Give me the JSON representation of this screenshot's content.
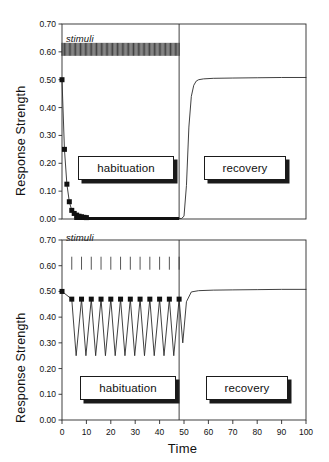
{
  "figure": {
    "top_cut_text": "",
    "x_axis": {
      "label": "Time",
      "ticks": [
        0,
        10,
        20,
        30,
        40,
        50,
        60,
        70,
        80,
        90,
        100
      ],
      "tick_labels": [
        "0",
        "10",
        "20",
        "30",
        "40",
        "50",
        "60",
        "70",
        "80",
        "90",
        "100"
      ],
      "min": 0,
      "max": 100
    },
    "panels": [
      {
        "name": "top-panel",
        "y_axis": {
          "label": "Response Strength",
          "ticks": [
            0.0,
            0.1,
            0.2,
            0.3,
            0.4,
            0.5,
            0.6,
            0.7
          ],
          "tick_labels": [
            "0.00",
            "0.10",
            "0.20",
            "0.30",
            "0.40",
            "0.50",
            "0.60",
            "0.70"
          ],
          "min": 0.0,
          "max": 0.7
        },
        "stimuli": {
          "label": "stimuli",
          "y": 0.6,
          "start": 0,
          "end": 48,
          "count": 96,
          "spacing": 0.5
        },
        "phase_labels": [
          {
            "text": "habituation",
            "start": 7,
            "end": 44
          },
          {
            "text": "recovery",
            "start": 56,
            "end": 93
          }
        ],
        "divider_x": 48
      },
      {
        "name": "bottom-panel",
        "y_axis": {
          "label": "Response Strength",
          "ticks": [
            0.0,
            0.1,
            0.2,
            0.3,
            0.4,
            0.5,
            0.6,
            0.7
          ],
          "tick_labels": [
            "0.00",
            "0.10",
            "0.20",
            "0.30",
            "0.40",
            "0.50",
            "0.60",
            "0.70"
          ],
          "min": 0.0,
          "max": 0.7
        },
        "stimuli": {
          "label": "stimuli",
          "y": 0.6,
          "start": 4,
          "end": 48,
          "count": 12,
          "spacing": 4
        },
        "phase_labels": [
          {
            "text": "habituation",
            "start": 7,
            "end": 44
          },
          {
            "text": "recovery",
            "start": 56,
            "end": 93
          }
        ],
        "divider_x": 48
      }
    ]
  },
  "chart_data": [
    {
      "type": "line",
      "title": "",
      "subtitle": "massed stimulation - rapid habituation, slow recovery",
      "xlabel": "Time",
      "ylabel": "Response Strength",
      "xlim": [
        0,
        100
      ],
      "ylim": [
        0.0,
        0.7
      ],
      "grid": false,
      "legend": "none",
      "series": [
        {
          "name": "response",
          "marker": "square",
          "x": [
            0.0,
            1.0,
            2.0,
            3.0,
            4.0,
            5.0,
            6.0,
            7.0,
            8.0,
            10.0,
            14.0,
            20.0,
            30.0,
            40.0,
            48.0,
            49.0,
            50.0,
            51.0,
            52.0,
            53.0,
            54.0,
            55.0,
            56.0,
            58.0,
            62.0,
            70.0,
            80.0,
            90.0,
            100.0
          ],
          "y": [
            0.5,
            0.25,
            0.125,
            0.062,
            0.031,
            0.02,
            0.014,
            0.01,
            0.008,
            0.006,
            0.004,
            0.003,
            0.002,
            0.002,
            0.002,
            0.002,
            0.01,
            0.12,
            0.33,
            0.44,
            0.48,
            0.495,
            0.5,
            0.503,
            0.505,
            0.506,
            0.507,
            0.508,
            0.508
          ]
        }
      ],
      "marker_points": {
        "x": [
          0,
          1,
          2,
          3,
          4,
          5,
          6,
          7,
          8,
          9,
          10
        ],
        "y": [
          0.5,
          0.25,
          0.125,
          0.062,
          0.031,
          0.02,
          0.014,
          0.01,
          0.008,
          0.006,
          0.005
        ]
      },
      "annotations": [
        "stimuli",
        "habituation",
        "recovery"
      ]
    },
    {
      "type": "line",
      "title": "",
      "subtitle": "spaced stimulation - slow habituation, fast recovery",
      "xlabel": "Time",
      "ylabel": "Response Strength",
      "xlim": [
        0,
        100
      ],
      "ylim": [
        0.0,
        0.7
      ],
      "grid": false,
      "legend": "none",
      "series": [
        {
          "name": "response",
          "marker": "square",
          "x": [
            0,
            4,
            5.8,
            8,
            9.8,
            12,
            13.8,
            16,
            17.8,
            20,
            21.8,
            24,
            25.8,
            28,
            29.8,
            32,
            33.8,
            36,
            37.8,
            40,
            41.8,
            44,
            45.8,
            48,
            49.5,
            51,
            53,
            56,
            62,
            70,
            80,
            90,
            100
          ],
          "y": [
            0.5,
            0.47,
            0.25,
            0.47,
            0.25,
            0.47,
            0.25,
            0.47,
            0.25,
            0.47,
            0.25,
            0.47,
            0.25,
            0.47,
            0.25,
            0.47,
            0.25,
            0.47,
            0.25,
            0.47,
            0.25,
            0.47,
            0.25,
            0.47,
            0.3,
            0.46,
            0.498,
            0.503,
            0.505,
            0.506,
            0.507,
            0.508,
            0.508
          ]
        }
      ],
      "marker_points": {
        "x": [
          0,
          4,
          8,
          12,
          16,
          20,
          24,
          28,
          32,
          36,
          40,
          44,
          48
        ],
        "y": [
          0.5,
          0.47,
          0.47,
          0.47,
          0.47,
          0.47,
          0.47,
          0.47,
          0.47,
          0.47,
          0.47,
          0.47,
          0.47
        ]
      },
      "annotations": [
        "stimuli",
        "habituation",
        "recovery"
      ]
    }
  ]
}
